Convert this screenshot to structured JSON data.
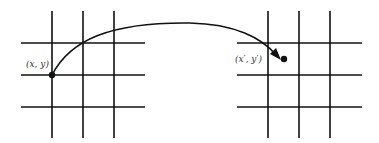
{
  "diagram": {
    "type": "grid-mapping",
    "source_grid": {
      "verticals_x": [
        52,
        83,
        114
      ],
      "horizontals_y": [
        43,
        75,
        107
      ]
    },
    "target_grid": {
      "verticals_x": [
        268,
        299,
        330
      ],
      "horizontals_y": [
        43,
        75,
        107
      ]
    },
    "source_point": {
      "label": "(x, y)",
      "x": 52,
      "y": 75
    },
    "target_point": {
      "label": "(x′, y′)",
      "x": 284,
      "y": 59
    },
    "line_color": "#111111"
  }
}
